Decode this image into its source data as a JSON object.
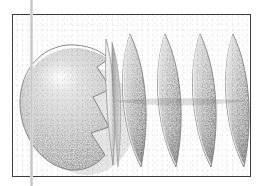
{
  "figure": {
    "kind": "3d-geometry-render",
    "caption": "",
    "frame": {
      "border_color": "#3d3d3d",
      "background_color": "#ffffff",
      "x": 12,
      "y": 14,
      "width": 239,
      "height": 163
    },
    "margin_rule": {
      "name": "page-margin-line",
      "color": "#d7d7d7",
      "x": 30,
      "width": 3
    },
    "palette": {
      "surface_light": "#e6e6e6",
      "surface_mid": "#b8b8b8",
      "surface_dark": "#8f8f8f",
      "surface_deep": "#6f6f6f",
      "edge_highlight": "#f2f2f2",
      "outline": "#7a7a7a",
      "speckle_light": "#eeeeee",
      "speckle_dark": "#8a8a8a"
    },
    "objects": [
      {
        "name": "sphere-body",
        "type": "sphere",
        "center_x": 66,
        "center_y": 101,
        "radius_x": 52,
        "radius_y": 58,
        "notch": true,
        "label": "sphere"
      },
      {
        "name": "lune-segment-1",
        "type": "lune",
        "center_x": 108,
        "top_y": 33,
        "bottom_y": 165,
        "half_width": 21,
        "label": "lune 1"
      },
      {
        "name": "lune-segment-2",
        "type": "lune",
        "center_x": 143,
        "top_y": 33,
        "bottom_y": 165,
        "half_width": 21,
        "label": "lune 2"
      },
      {
        "name": "lune-segment-3",
        "type": "lune",
        "center_x": 178,
        "top_y": 33,
        "bottom_y": 165,
        "half_width": 21,
        "label": "lune 3"
      },
      {
        "name": "lune-segment-4",
        "type": "lune",
        "center_x": 212,
        "top_y": 33,
        "bottom_y": 165,
        "half_width": 21,
        "label": "lune 4"
      },
      {
        "name": "lune-segment-5",
        "type": "lune",
        "center_x": 243,
        "top_y": 33,
        "bottom_y": 165,
        "half_width": 21,
        "label": "lune 5"
      }
    ],
    "segment_count": 5,
    "texture": "stippled-granular"
  }
}
